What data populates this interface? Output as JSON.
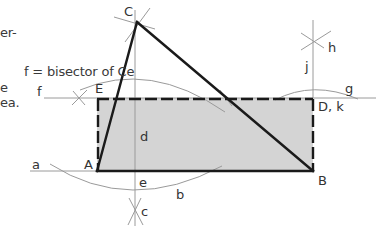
{
  "caption_fragments": [
    {
      "text": "er-",
      "x": 0,
      "y": 32
    },
    {
      "text": "f = bisector of Ce",
      "x": 24,
      "y": 66
    },
    {
      "text": "e",
      "x": 0,
      "y": 82
    },
    {
      "text": "ea.",
      "x": 0,
      "y": 101
    }
  ],
  "labels": {
    "C": "C",
    "E": "E",
    "f": "f",
    "g": "g",
    "h": "h",
    "j": "j",
    "Dk": "D, k",
    "d": "d",
    "a": "a",
    "A": "A",
    "e": "e",
    "b": "b",
    "B": "B",
    "c": "c"
  },
  "colors": {
    "fill": "#d4d4d4",
    "heavy_line": "#1a1a1a",
    "construction_line": "#9a9a9a"
  },
  "points": {
    "A": [
      97,
      171
    ],
    "B": [
      313,
      171
    ],
    "C": [
      137,
      22
    ],
    "D": [
      313,
      98
    ],
    "E": [
      97,
      98
    ]
  }
}
